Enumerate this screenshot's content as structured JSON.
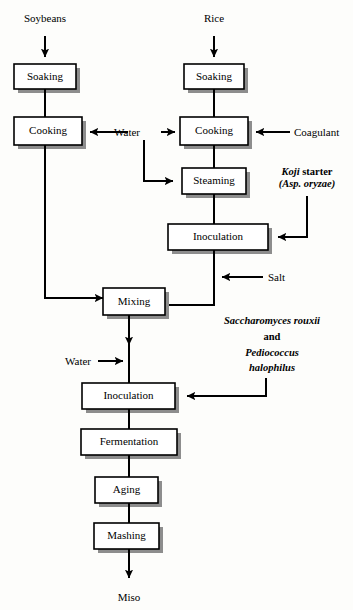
{
  "diagram": {
    "colors": {
      "line": "#000000",
      "box_fill": "#ffffff",
      "box_stroke": "#000000",
      "shadow": "#8d8d8d",
      "background": "#fdfdfb"
    },
    "inputs": {
      "soybeans": "Soybeans",
      "rice": "Rice"
    },
    "output": {
      "miso": "Miso"
    },
    "boxes": {
      "soy_soaking": "Soaking",
      "soy_cooking": "Cooking",
      "rice_soaking": "Soaking",
      "rice_cooking": "Cooking",
      "steaming": "Steaming",
      "koji_inoculation": "Inoculation",
      "mixing": "Mixing",
      "main_inoculation": "Inoculation",
      "fermentation": "Fermentation",
      "aging": "Aging",
      "mashing": "Mashing"
    },
    "side_labels": {
      "water_top": "Water",
      "water_bottom": "Water",
      "coagulant": "Coagulant",
      "salt": "Salt"
    },
    "annotations": {
      "koji": {
        "line1_italic": "Koji",
        "line1_roman": " starter",
        "line2_italic": "(Asp. oryzae)"
      },
      "culture": {
        "line1": "Saccharomyces rouxii",
        "line2": "and",
        "line3": "Pediococcus",
        "line4": "halophilus"
      }
    }
  }
}
